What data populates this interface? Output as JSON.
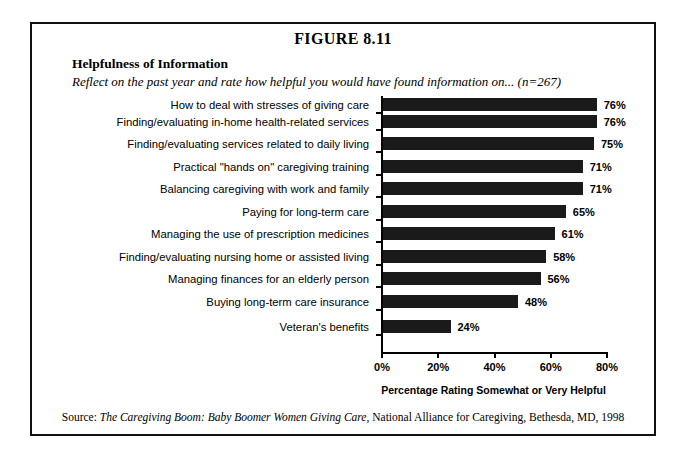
{
  "figure": {
    "number": "FIGURE 8.11",
    "title": "Helpfulness of Information",
    "subtitle": "Reflect on the past year and rate how helpful you would have found information on... (n=267)"
  },
  "source": {
    "label": "Source: ",
    "title": "The Caregiving Boom: Baby Boomer Women Giving Care",
    "rest": ", National Alliance for Caregiving, Bethesda, MD, 1998"
  },
  "chart_data": {
    "type": "bar",
    "orientation": "horizontal",
    "title": "Helpfulness of Information",
    "subtitle": "Reflect on the past year and rate how helpful you would have found information on... (n=267)",
    "xlabel": "Percentage Rating Somewhat or Very Helpful",
    "ylabel": "",
    "xlim": [
      0,
      80
    ],
    "grid": false,
    "legend": "none",
    "sample_size": 267,
    "xticks": [
      0,
      20,
      40,
      60,
      80
    ],
    "xtick_labels": [
      "0%",
      "20%",
      "40%",
      "60%",
      "80%"
    ],
    "categories": [
      "How to deal with stresses of giving care",
      "Finding/evaluating in-home health-related services",
      "Finding/evaluating services related to daily living",
      "Practical \"hands on\" caregiving training",
      "Balancing caregiving with work and family",
      "Paying for long-term care",
      "Managing the use of prescription medicines",
      "Finding/evaluating nursing home or assisted living",
      "Managing finances for an elderly person",
      "Buying long-term care insurance",
      "Veteran's benefits"
    ],
    "values": [
      76,
      76,
      75,
      71,
      71,
      65,
      61,
      58,
      56,
      48,
      24
    ],
    "value_labels": [
      "76%",
      "76%",
      "75%",
      "71%",
      "71%",
      "65%",
      "61%",
      "58%",
      "56%",
      "48%",
      "24%"
    ],
    "bar_color": "#1a1a1a"
  }
}
